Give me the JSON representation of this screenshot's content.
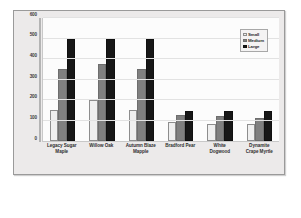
{
  "chart_data": {
    "type": "bar",
    "title": "",
    "xlabel": "",
    "ylabel": "",
    "ylim": [
      0,
      600
    ],
    "yticks": [
      0,
      100,
      200,
      300,
      400,
      500,
      600
    ],
    "grid": true,
    "legend_position": "top-right",
    "categories": [
      "Legacy Sugar Maple",
      "Willow Oak",
      "Autumn Blaze Mapple",
      "Bradford Pear",
      "White Dogwood",
      "Dynamite Crape Myrtle"
    ],
    "category_lines": [
      [
        "Legacy Sugar",
        "Maple"
      ],
      [
        "Willow Oak"
      ],
      [
        "Autumn Blaze",
        "Mapple"
      ],
      [
        "Bradford Pear"
      ],
      [
        "White",
        "Dogwood"
      ],
      [
        "Dynamite",
        "Crape Myrtle"
      ]
    ],
    "series": [
      {
        "name": "Small",
        "color": "#efefef",
        "values": [
          150,
          200,
          150,
          95,
          85,
          85
        ]
      },
      {
        "name": "Medium",
        "color": "#808080",
        "values": [
          350,
          375,
          350,
          125,
          120,
          110
        ]
      },
      {
        "name": "Large",
        "color": "#171717",
        "values": [
          500,
          500,
          500,
          145,
          145,
          145
        ]
      }
    ]
  },
  "legend": {
    "items": [
      {
        "label": "Small"
      },
      {
        "label": "Medium"
      },
      {
        "label": "Large"
      }
    ]
  },
  "caption_artifact": ""
}
